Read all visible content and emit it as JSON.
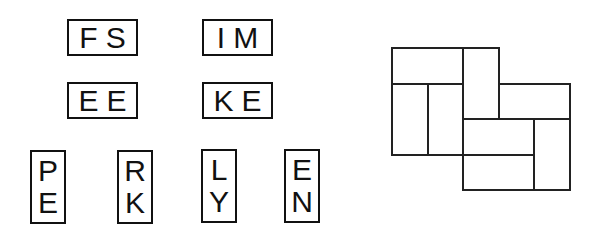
{
  "puzzle": {
    "tiles": [
      {
        "id": "fs",
        "orientation": "horizontal",
        "letters": [
          "F",
          "S"
        ],
        "x": 67,
        "y": 19
      },
      {
        "id": "im",
        "orientation": "horizontal",
        "letters": [
          "I",
          "M"
        ],
        "x": 202,
        "y": 19
      },
      {
        "id": "ee",
        "orientation": "horizontal",
        "letters": [
          "E",
          "E"
        ],
        "x": 67,
        "y": 82
      },
      {
        "id": "ke",
        "orientation": "horizontal",
        "letters": [
          "K",
          "E"
        ],
        "x": 202,
        "y": 82
      },
      {
        "id": "pe",
        "orientation": "vertical",
        "letters": [
          "P",
          "E"
        ],
        "x": 30,
        "y": 150
      },
      {
        "id": "rk",
        "orientation": "vertical",
        "letters": [
          "R",
          "K"
        ],
        "x": 117,
        "y": 150
      },
      {
        "id": "ly",
        "orientation": "vertical",
        "letters": [
          "L",
          "Y"
        ],
        "x": 201,
        "y": 149
      },
      {
        "id": "en",
        "orientation": "vertical",
        "letters": [
          "E",
          "N"
        ],
        "x": 284,
        "y": 149
      }
    ],
    "board": {
      "unit": 35.5,
      "origin": [
        391,
        47
      ],
      "slots": [
        {
          "col": 0,
          "row": 0,
          "w": 2,
          "h": 1
        },
        {
          "col": 2,
          "row": 0,
          "w": 1,
          "h": 2
        },
        {
          "col": 0,
          "row": 1,
          "w": 1,
          "h": 2
        },
        {
          "col": 1,
          "row": 1,
          "w": 1,
          "h": 2
        },
        {
          "col": 3,
          "row": 1,
          "w": 2,
          "h": 1
        },
        {
          "col": 2,
          "row": 2,
          "w": 2,
          "h": 1
        },
        {
          "col": 2,
          "row": 3,
          "w": 2,
          "h": 1
        },
        {
          "col": 4,
          "row": 2,
          "w": 1,
          "h": 2
        }
      ]
    }
  }
}
